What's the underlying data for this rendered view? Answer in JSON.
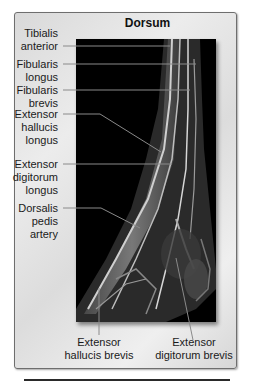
{
  "figure": {
    "title": "Dorsum",
    "left_labels": [
      {
        "id": "tibialis-anterior",
        "line1": "Tibialis",
        "line2": "anterior",
        "line3": ""
      },
      {
        "id": "fibularis-longus",
        "line1": "Fibularis",
        "line2": "longus",
        "line3": ""
      },
      {
        "id": "fibularis-brevis",
        "line1": "Fibularis",
        "line2": "brevis",
        "line3": ""
      },
      {
        "id": "extensor-hallucis-longus",
        "line1": "Extensor",
        "line2": "hallucis",
        "line3": "longus"
      },
      {
        "id": "extensor-digitorum-longus",
        "line1": "Extensor",
        "line2": "digitorum",
        "line3": "longus"
      },
      {
        "id": "dorsalis-pedis-artery",
        "line1": "Dorsalis",
        "line2": "pedis",
        "line3": "artery"
      }
    ],
    "bottom_labels": [
      {
        "id": "extensor-hallucis-brevis",
        "line1": "Extensor",
        "line2": "hallucis brevis"
      },
      {
        "id": "extensor-digitorum-brevis",
        "line1": "Extensor",
        "line2": "digitorum brevis"
      }
    ],
    "colors": {
      "frame_border": "#6e6e6e",
      "frame_bg": "#e3e3e3",
      "image_bg": "#000000",
      "leader_line": "#8a8a8a",
      "text": "#1a1a1a"
    }
  }
}
